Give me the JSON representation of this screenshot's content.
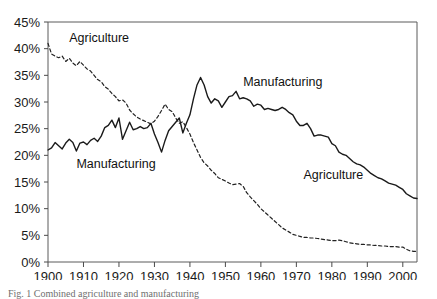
{
  "figure": {
    "caption": "Fig. 1 Combined agriculture and manufacturing"
  },
  "chart_data": {
    "type": "line",
    "title": "",
    "xlabel": "",
    "ylabel": "",
    "xlim": [
      1900,
      2004
    ],
    "ylim": [
      0,
      45
    ],
    "grid": false,
    "legend": "inline-annotations",
    "x_ticks": [
      "1900",
      "1910",
      "1920",
      "1930",
      "1940",
      "1950",
      "1960",
      "1970",
      "1980",
      "1990",
      "2000"
    ],
    "x_tick_values": [
      1900,
      1910,
      1920,
      1930,
      1940,
      1950,
      1960,
      1970,
      1980,
      1990,
      2000
    ],
    "y_ticks": [
      "0%",
      "5%",
      "10%",
      "15%",
      "20%",
      "25%",
      "30%",
      "35%",
      "40%",
      "45%"
    ],
    "y_tick_values": [
      0,
      5,
      10,
      15,
      20,
      25,
      30,
      35,
      40,
      45
    ],
    "annotations": [
      {
        "text": "Agriculture",
        "x": 1906,
        "y": 41.2,
        "series": "Agriculture"
      },
      {
        "text": "Manufacturing",
        "x": 1908,
        "y": 17.6,
        "series": "Manufacturing"
      },
      {
        "text": "Manufacturing",
        "x": 1955,
        "y": 33.0,
        "series": "Manufacturing"
      },
      {
        "text": "Agriculture",
        "x": 1972,
        "y": 15.6,
        "series": "Agriculture"
      }
    ],
    "series": [
      {
        "name": "Agriculture",
        "style": "dashed",
        "color": "#222222",
        "x": [
          1900,
          1901,
          1902,
          1903,
          1904,
          1905,
          1906,
          1907,
          1908,
          1909,
          1910,
          1911,
          1912,
          1913,
          1914,
          1915,
          1916,
          1917,
          1918,
          1919,
          1920,
          1921,
          1922,
          1923,
          1924,
          1925,
          1926,
          1927,
          1928,
          1929,
          1930,
          1931,
          1932,
          1933,
          1934,
          1935,
          1936,
          1937,
          1938,
          1939,
          1940,
          1941,
          1942,
          1943,
          1944,
          1945,
          1946,
          1947,
          1948,
          1949,
          1950,
          1951,
          1952,
          1953,
          1954,
          1955,
          1956,
          1957,
          1958,
          1959,
          1960,
          1961,
          1962,
          1963,
          1964,
          1965,
          1966,
          1967,
          1968,
          1969,
          1970,
          1971,
          1972,
          1973,
          1974,
          1975,
          1976,
          1977,
          1978,
          1979,
          1980,
          1981,
          1982,
          1983,
          1984,
          1985,
          1986,
          1987,
          1988,
          1989,
          1990,
          1991,
          1992,
          1993,
          1994,
          1995,
          1996,
          1997,
          1998,
          1999,
          2000,
          2001,
          2002,
          2003,
          2004
        ],
        "values": [
          41.0,
          39.0,
          38.6,
          38.3,
          38.6,
          37.6,
          38.2,
          37.3,
          36.8,
          37.6,
          36.9,
          36.2,
          35.8,
          35.0,
          34.2,
          33.8,
          32.9,
          32.4,
          31.6,
          31.0,
          30.2,
          30.4,
          29.8,
          28.5,
          27.8,
          27.2,
          26.8,
          26.5,
          26.2,
          25.9,
          26.4,
          27.3,
          28.4,
          29.6,
          28.6,
          28.2,
          27.0,
          26.0,
          26.3,
          25.2,
          24.0,
          22.4,
          21.0,
          19.6,
          18.6,
          18.0,
          17.2,
          16.6,
          15.8,
          15.5,
          15.2,
          14.8,
          14.5,
          14.6,
          14.7,
          14.2,
          13.0,
          12.2,
          11.5,
          10.8,
          10.0,
          9.4,
          8.8,
          8.2,
          7.6,
          7.0,
          6.4,
          6.0,
          5.6,
          5.2,
          5.0,
          4.8,
          4.6,
          4.6,
          4.5,
          4.5,
          4.4,
          4.3,
          4.2,
          4.1,
          4.0,
          4.0,
          4.1,
          4.0,
          3.8,
          3.6,
          3.5,
          3.4,
          3.3,
          3.3,
          3.2,
          3.2,
          3.1,
          3.1,
          3.0,
          3.0,
          2.9,
          2.9,
          2.9,
          2.8,
          2.8,
          2.4,
          2.1,
          2.0,
          2.0
        ]
      },
      {
        "name": "Manufacturing",
        "style": "solid",
        "color": "#1a1a1a",
        "x": [
          1900,
          1901,
          1902,
          1903,
          1904,
          1905,
          1906,
          1907,
          1908,
          1909,
          1910,
          1911,
          1912,
          1913,
          1914,
          1915,
          1916,
          1917,
          1918,
          1919,
          1920,
          1921,
          1922,
          1923,
          1924,
          1925,
          1926,
          1927,
          1928,
          1929,
          1930,
          1931,
          1932,
          1933,
          1934,
          1935,
          1936,
          1937,
          1938,
          1939,
          1940,
          1941,
          1942,
          1943,
          1944,
          1945,
          1946,
          1947,
          1948,
          1949,
          1950,
          1951,
          1952,
          1953,
          1954,
          1955,
          1956,
          1957,
          1958,
          1959,
          1960,
          1961,
          1962,
          1963,
          1964,
          1965,
          1966,
          1967,
          1968,
          1969,
          1970,
          1971,
          1972,
          1973,
          1974,
          1975,
          1976,
          1977,
          1978,
          1979,
          1980,
          1981,
          1982,
          1983,
          1984,
          1985,
          1986,
          1987,
          1988,
          1989,
          1990,
          1991,
          1992,
          1993,
          1994,
          1995,
          1996,
          1997,
          1998,
          1999,
          2000,
          2001,
          2002,
          2003,
          2004
        ],
        "values": [
          21.0,
          21.4,
          22.4,
          21.8,
          21.2,
          22.3,
          23.0,
          22.4,
          20.8,
          22.3,
          22.5,
          22.0,
          22.8,
          23.2,
          22.6,
          23.6,
          25.2,
          25.6,
          26.6,
          25.2,
          27.0,
          23.0,
          24.6,
          26.2,
          24.8,
          25.0,
          25.4,
          25.0,
          25.2,
          26.0,
          24.0,
          22.4,
          20.6,
          22.8,
          24.6,
          25.4,
          26.2,
          27.0,
          24.2,
          26.0,
          27.6,
          30.6,
          33.2,
          34.6,
          33.2,
          31.0,
          29.8,
          30.6,
          30.2,
          29.0,
          30.0,
          31.0,
          31.2,
          32.0,
          30.6,
          30.8,
          30.6,
          30.2,
          29.2,
          29.6,
          29.4,
          28.6,
          28.8,
          28.6,
          28.4,
          28.6,
          29.0,
          28.6,
          28.0,
          27.6,
          26.4,
          25.6,
          25.6,
          26.0,
          25.0,
          23.6,
          23.8,
          23.8,
          23.6,
          23.4,
          22.2,
          21.8,
          20.6,
          20.2,
          20.0,
          19.4,
          18.8,
          18.4,
          18.2,
          17.8,
          17.2,
          16.6,
          16.2,
          15.8,
          15.6,
          15.2,
          14.8,
          14.6,
          14.4,
          14.0,
          13.6,
          12.8,
          12.4,
          12.0,
          11.9
        ]
      }
    ]
  }
}
